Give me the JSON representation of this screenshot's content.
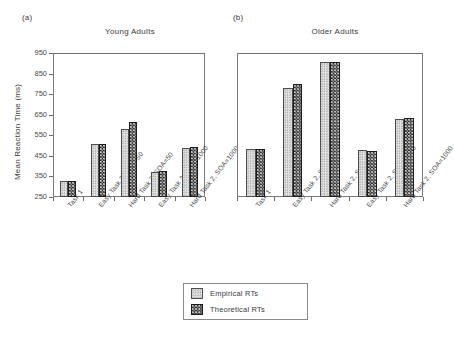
{
  "figure": {
    "panels": [
      {
        "tag": "(a)",
        "title": "Young Adults"
      },
      {
        "tag": "(b)",
        "title": "Older Adults"
      }
    ],
    "legend": {
      "entries": [
        {
          "label": "Empirical RTs",
          "swatch": "light-dotted"
        },
        {
          "label": "Theoretical RTs",
          "swatch": "dark-checkered"
        }
      ]
    }
  },
  "chart_data": [
    {
      "type": "bar",
      "title": "Young Adults",
      "panel_tag": "(a)",
      "xlabel": "",
      "ylabel": "Mean Reaction Time (ms)",
      "ylim": [
        250,
        950
      ],
      "yticks": [
        250,
        350,
        450,
        550,
        650,
        750,
        850,
        950
      ],
      "grid": false,
      "legend_position": "bottom-center-shared",
      "categories": [
        "Task 1",
        "Easy Task 2, SOA=50",
        "Hard Task 2, SOA=50",
        "Easy Task 2, SOA=1000",
        "Hard Task 2, SOA=1000"
      ],
      "series": [
        {
          "name": "Empirical RTs",
          "values": [
            330,
            510,
            583,
            370,
            490
          ]
        },
        {
          "name": "Theoretical RTs",
          "values": [
            330,
            508,
            613,
            375,
            492
          ]
        }
      ]
    },
    {
      "type": "bar",
      "title": "Older Adults",
      "panel_tag": "(b)",
      "xlabel": "",
      "ylabel": "Mean Reaction Time (ms)",
      "ylim": [
        250,
        950
      ],
      "yticks": [
        250,
        350,
        450,
        550,
        650,
        750,
        850,
        950
      ],
      "grid": false,
      "legend_position": "bottom-center-shared",
      "categories": [
        "Task 1",
        "Easy Task 2, SOA=50",
        "Hard Task 2, SOA=50",
        "Easy Task 2, SOA=1000",
        "Hard Task 2, SOA=1000"
      ],
      "series": [
        {
          "name": "Empirical RTs",
          "values": [
            485,
            782,
            905,
            480,
            630
          ]
        },
        {
          "name": "Theoretical RTs",
          "values": [
            485,
            800,
            908,
            472,
            633
          ]
        }
      ]
    }
  ]
}
